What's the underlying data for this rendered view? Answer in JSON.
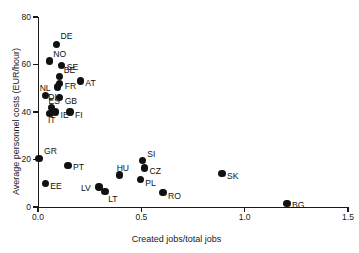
{
  "chart_data": {
    "type": "scatter",
    "title": "",
    "xlabel": "Created jobs/total jobs",
    "ylabel": "Average personnel costs (EUR/hour)",
    "xlim": [
      0.0,
      1.5
    ],
    "ylim": [
      0,
      80
    ],
    "xticks": [
      "0.0",
      "0.5",
      "1.0",
      "1.5"
    ],
    "xtick_values": [
      0.0,
      0.5,
      1.0,
      1.5
    ],
    "yticks": [
      "0",
      "20",
      "40",
      "60",
      "80"
    ],
    "ytick_values": [
      0,
      20,
      40,
      60,
      80
    ],
    "grid": false,
    "legend": "none",
    "marker": "filled-circle",
    "marker_color": "#111111",
    "axis_color": "#1a1a1a",
    "points": [
      {
        "label": "DE",
        "x": 0.09,
        "y": 68.5,
        "label_dx": 4,
        "label_dy": -12
      },
      {
        "label": "NO",
        "x": 0.055,
        "y": 61.5,
        "label_dx": 4,
        "label_dy": -11
      },
      {
        "label": "SE",
        "x": 0.115,
        "y": 59.5,
        "label_dx": 5,
        "label_dy": -3
      },
      {
        "label": "BE",
        "x": 0.105,
        "y": 55.0,
        "label_dx": 4,
        "label_dy": -10
      },
      {
        "label": "FR",
        "x": 0.105,
        "y": 52.0,
        "label_dx": 5,
        "label_dy": -2
      },
      {
        "label": "AT",
        "x": 0.205,
        "y": 53.0,
        "label_dx": 5,
        "label_dy": -2
      },
      {
        "label": "NL",
        "x": 0.095,
        "y": 50.5,
        "label_dx": -18,
        "label_dy": -3
      },
      {
        "label": "DK",
        "x": 0.035,
        "y": 47.0,
        "label_dx": 3,
        "label_dy": -2
      },
      {
        "label": "GB",
        "x": 0.105,
        "y": 46.0,
        "label_dx": 5,
        "label_dy": -1
      },
      {
        "label": "ES",
        "x": 0.065,
        "y": 42.0,
        "label_dx": -3,
        "label_dy": -10
      },
      {
        "label": "IT",
        "x": 0.058,
        "y": 39.5,
        "label_dx": -2,
        "label_dy": 3
      },
      {
        "label": "IE",
        "x": 0.085,
        "y": 40.0,
        "label_dx": 5,
        "label_dy": -1
      },
      {
        "label": "FI",
        "x": 0.155,
        "y": 40.0,
        "label_dx": 5,
        "label_dy": -1
      },
      {
        "label": "GR",
        "x": 0.005,
        "y": 20.5,
        "label_dx": 5,
        "label_dy": -11
      },
      {
        "label": "PT",
        "x": 0.145,
        "y": 17.5,
        "label_dx": 5,
        "label_dy": -2
      },
      {
        "label": "EE",
        "x": 0.035,
        "y": 10.0,
        "label_dx": 5,
        "label_dy": -1
      },
      {
        "label": "LV",
        "x": 0.295,
        "y": 8.5,
        "label_dx": -18,
        "label_dy": -3
      },
      {
        "label": "LT",
        "x": 0.325,
        "y": 6.5,
        "label_dx": 3,
        "label_dy": 3
      },
      {
        "label": "HU",
        "x": 0.395,
        "y": 13.5,
        "label_dx": -3,
        "label_dy": -11
      },
      {
        "label": "SI",
        "x": 0.505,
        "y": 19.5,
        "label_dx": 5,
        "label_dy": -11
      },
      {
        "label": "CZ",
        "x": 0.515,
        "y": 16.5,
        "label_dx": 5,
        "label_dy": -1
      },
      {
        "label": "PL",
        "x": 0.495,
        "y": 11.5,
        "label_dx": 5,
        "label_dy": -1
      },
      {
        "label": "RO",
        "x": 0.605,
        "y": 6.0,
        "label_dx": 5,
        "label_dy": -1
      },
      {
        "label": "SK",
        "x": 0.89,
        "y": 14.0,
        "label_dx": 5,
        "label_dy": -2
      },
      {
        "label": "BG",
        "x": 1.205,
        "y": 1.5,
        "label_dx": 5,
        "label_dy": -2
      }
    ]
  }
}
